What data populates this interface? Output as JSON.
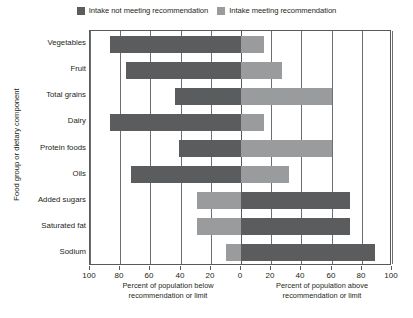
{
  "legend": {
    "items": [
      {
        "label": "Intake not meeting recommendation",
        "color": "#5b5c5e",
        "icon": "legend-swatch-dark"
      },
      {
        "label": "Intake meeting recommendation",
        "color": "#9a9b9d",
        "icon": "legend-swatch-light"
      }
    ]
  },
  "chart_data": {
    "type": "bar",
    "title": "",
    "subtitle": "",
    "orientation": "horizontal",
    "style": "diverging-stacked",
    "ylabel": "Food group or dietary component",
    "xlabel_left": "Percent of population below recommendation or limit",
    "xlabel_right": "Percent of population above recommendation or limit",
    "xlabel_left_lines": [
      "Percent of population below",
      "recommendation or limit"
    ],
    "xlabel_right_lines": [
      "Percent of population above",
      "recommendation or limit"
    ],
    "xlim": [
      -100,
      100
    ],
    "xticks": [
      -100,
      -80,
      -60,
      -40,
      -20,
      0,
      20,
      40,
      60,
      80,
      100
    ],
    "xticklabels": [
      "100",
      "80",
      "60",
      "40",
      "20",
      "0",
      "20",
      "40",
      "60",
      "80",
      "100"
    ],
    "grid": true,
    "legend_position": "top-center",
    "categories": [
      "Vegetables",
      "Fruit",
      "Total grains",
      "Dairy",
      "Protein foods",
      "Oils",
      "Added sugars",
      "Saturated fat",
      "Sodium"
    ],
    "series": [
      {
        "name": "Intake not meeting recommendation",
        "color": "#5b5c5e",
        "values": [
          -87,
          -76,
          -44,
          -87,
          -41,
          -73,
          72,
          72,
          89
        ]
      },
      {
        "name": "Intake meeting recommendation",
        "color": "#9a9b9d",
        "values": [
          15,
          27,
          60,
          15,
          60,
          32,
          -29,
          -29,
          -10
        ]
      }
    ],
    "bars": [
      {
        "category": "Vegetables",
        "below": 87,
        "above": 15,
        "below_color": "#5b5c5e",
        "above_color": "#9a9b9d",
        "not_meeting_side": "below"
      },
      {
        "category": "Fruit",
        "below": 76,
        "above": 27,
        "below_color": "#5b5c5e",
        "above_color": "#9a9b9d",
        "not_meeting_side": "below"
      },
      {
        "category": "Total grains",
        "below": 44,
        "above": 60,
        "below_color": "#5b5c5e",
        "above_color": "#9a9b9d",
        "not_meeting_side": "below"
      },
      {
        "category": "Dairy",
        "below": 87,
        "above": 15,
        "below_color": "#5b5c5e",
        "above_color": "#9a9b9d",
        "not_meeting_side": "below"
      },
      {
        "category": "Protein foods",
        "below": 41,
        "above": 60,
        "below_color": "#5b5c5e",
        "above_color": "#9a9b9d",
        "not_meeting_side": "below"
      },
      {
        "category": "Oils",
        "below": 73,
        "above": 32,
        "below_color": "#5b5c5e",
        "above_color": "#9a9b9d",
        "not_meeting_side": "below"
      },
      {
        "category": "Added sugars",
        "below": 29,
        "above": 72,
        "below_color": "#9a9b9d",
        "above_color": "#5b5c5e",
        "not_meeting_side": "above"
      },
      {
        "category": "Saturated fat",
        "below": 29,
        "above": 72,
        "below_color": "#9a9b9d",
        "above_color": "#5b5c5e",
        "not_meeting_side": "above"
      },
      {
        "category": "Sodium",
        "below": 10,
        "above": 89,
        "below_color": "#9a9b9d",
        "above_color": "#5b5c5e",
        "not_meeting_side": "above"
      }
    ]
  },
  "colors": {
    "not_meeting": "#5b5c5e",
    "meeting": "#9a9b9d",
    "axis": "#58595b",
    "grid": "#6d6e71",
    "text": "#231f20",
    "background": "#ffffff"
  }
}
